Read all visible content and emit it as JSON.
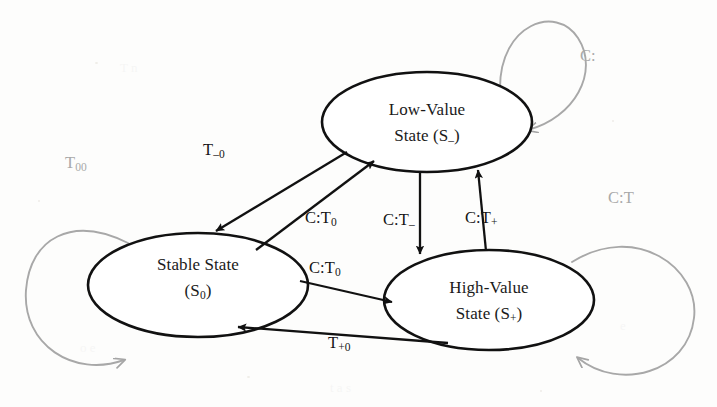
{
  "diagram": {
    "type": "state-transition-diagram",
    "colors": {
      "node_stroke": "#111111",
      "edge_stroke": "#111111",
      "self_loop_stroke": "#aaaaaa",
      "text": "#1a1a1a",
      "faded_text": "#a9a9a9",
      "background": "#fdfdfc"
    },
    "nodes": [
      {
        "id": "stable",
        "name": "stable-state-node",
        "line1": "Stable State",
        "line2_base": "(S",
        "line2_sub": "0",
        "line2_tail": ")",
        "cx": 198,
        "cy": 285,
        "rx": 110,
        "ry": 52
      },
      {
        "id": "low",
        "name": "low-value-state-node",
        "line1": "Low-Value",
        "line2_base": "State (S",
        "line2_sub": "–",
        "line2_tail": ")",
        "cx": 427,
        "cy": 122,
        "rx": 105,
        "ry": 50
      },
      {
        "id": "high",
        "name": "high-value-state-node",
        "line1": "High-Value",
        "line2_base": "State (S",
        "line2_sub": "+",
        "line2_tail": ")",
        "cx": 489,
        "cy": 300,
        "rx": 105,
        "ry": 50
      }
    ],
    "transitions": [
      {
        "id": "low-to-stable",
        "name": "transition-low-to-stable",
        "from": "low",
        "to": "stable",
        "base": "T",
        "sub": "–0",
        "label_x": 203,
        "label_y": 140
      },
      {
        "id": "stable-to-low",
        "name": "transition-stable-to-low",
        "from": "stable",
        "to": "low",
        "base": "C:T",
        "sub": "0",
        "label_x": 305,
        "label_y": 208
      },
      {
        "id": "low-to-high",
        "name": "transition-low-to-high",
        "from": "low",
        "to": "high",
        "base": "C:T",
        "sub": "–",
        "label_x": 383,
        "label_y": 210
      },
      {
        "id": "high-to-low",
        "name": "transition-high-to-low",
        "from": "high",
        "to": "low",
        "base": "C:T",
        "sub": "+",
        "label_x": 465,
        "label_y": 208
      },
      {
        "id": "stable-to-high",
        "name": "transition-stable-to-high",
        "from": "stable",
        "to": "high",
        "base": "C:T",
        "sub": "0",
        "label_x": 309,
        "label_y": 258
      },
      {
        "id": "high-to-stable",
        "name": "transition-high-to-stable",
        "from": "high",
        "to": "stable",
        "base": "T",
        "sub": "+0",
        "label_x": 328,
        "label_y": 333
      }
    ],
    "self_loops": [
      {
        "id": "stable-loop",
        "name": "self-loop-stable",
        "node": "stable",
        "base": "T",
        "sub": "00",
        "label_x": 65,
        "label_y": 153
      },
      {
        "id": "low-loop",
        "name": "self-loop-low-value",
        "node": "low",
        "base": "C:",
        "sub": "",
        "label_x": 580,
        "label_y": 46
      },
      {
        "id": "high-loop",
        "name": "self-loop-high-value",
        "node": "high",
        "base": "C:T",
        "sub": "",
        "label_x": 608,
        "label_y": 188
      }
    ]
  }
}
